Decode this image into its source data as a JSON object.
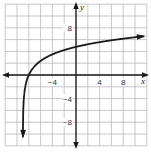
{
  "chart_data": {
    "type": "line",
    "title": "",
    "xlabel": "x",
    "ylabel": "y",
    "xlim": [
      -12,
      12
    ],
    "ylim": [
      -12,
      12
    ],
    "grid": true,
    "grid_step": 2,
    "x_ticks": [
      {
        "value": -4,
        "label": "−4"
      },
      {
        "value": 4,
        "label": "4"
      },
      {
        "value": 8,
        "label": "8"
      }
    ],
    "y_ticks": [
      {
        "value": 8,
        "label": "8"
      },
      {
        "value": -4,
        "label": "−4"
      },
      {
        "value": -8,
        "label": "−8"
      }
    ],
    "series": [
      {
        "name": "logarithmic curve",
        "description": "increasing logarithmic curve with vertical asymptote near x = -9, both ends arrowed",
        "x": [
          -8.996,
          -8.95,
          -8.9,
          -8.8,
          -8.6,
          -8.3,
          -8,
          -7,
          -6,
          -5,
          -4,
          -2,
          0,
          2,
          4,
          6,
          8,
          10,
          12
        ],
        "y": [
          -11.8,
          -6.5,
          -5.0,
          -3.5,
          -2.0,
          -0.8,
          0,
          1.5,
          2.4,
          3.0,
          3.5,
          4.2,
          4.8,
          5.2,
          5.6,
          5.9,
          6.2,
          6.4,
          6.6
        ]
      }
    ],
    "color": "#1a1a1a",
    "grid_color": "#b9b9b9"
  }
}
